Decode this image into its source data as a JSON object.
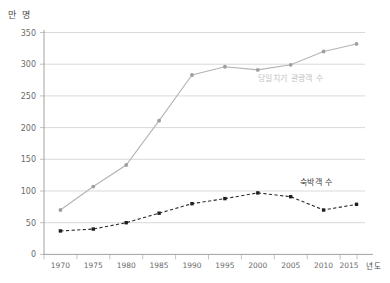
{
  "chart_data": {
    "type": "line",
    "title": "",
    "xlabel": "년도",
    "ylabel": "만 명",
    "ylim": [
      0,
      350
    ],
    "yticks": [
      0,
      50,
      100,
      150,
      200,
      250,
      300,
      350
    ],
    "grid": true,
    "legend_position": "inline-right",
    "categories": [
      "1970",
      "1975",
      "1980",
      "1985",
      "1990",
      "1995",
      "2000",
      "2005",
      "2010",
      "2015"
    ],
    "series": [
      {
        "name": "당일치기 관광객 수",
        "style": "solid",
        "color": "#b4b4b4",
        "marker": "circle",
        "values": [
          70,
          107,
          141,
          211,
          283,
          296,
          291,
          299,
          320,
          332
        ]
      },
      {
        "name": "숙박객 수",
        "style": "dashed",
        "color": "#1f1f1f",
        "marker": "square",
        "values": [
          37,
          40,
          50,
          65,
          80,
          88,
          97,
          91,
          70,
          79
        ]
      }
    ]
  },
  "axes": {
    "y_unit_label": "만 명",
    "x_unit_label": "년도",
    "y_tick_labels": [
      "350",
      "300",
      "250",
      "200",
      "150",
      "100",
      "50",
      "0"
    ],
    "x_tick_labels": [
      "1970",
      "1975",
      "1980",
      "1985",
      "1990",
      "1995",
      "2000",
      "2005",
      "2010",
      "2015"
    ]
  },
  "labels": {
    "upper_series": "당일치기 관광객 수",
    "lower_series": "숙박객 수"
  },
  "colors": {
    "upper_line": "#b4b4b4",
    "lower_line": "#1f1f1f",
    "grid": "#c8c8c8",
    "axis": "#8a8a8a",
    "tick_text": "#6b6b6b",
    "background": "#ffffff"
  }
}
